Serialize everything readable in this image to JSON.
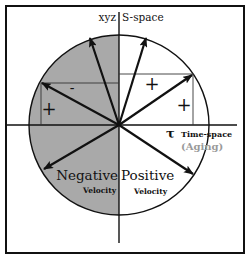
{
  "diagram": {
    "axes": {
      "vertical_label_left": "xyz",
      "vertical_label_right": "S-space",
      "horizontal_symbol": "τ",
      "horizontal_label": "Time-space",
      "horizontal_sublabel": "(Aging)"
    },
    "regions": {
      "negative_title": "Negative",
      "negative_sub": "Velocity",
      "positive_title": "Positive",
      "positive_sub": "Velocity"
    },
    "signs": {
      "left_box_top": "-",
      "left_box_side": "+",
      "right_box_top": "+",
      "right_box_side": "+"
    },
    "colors": {
      "negative_fill": "#a9a9a9",
      "line": "#111111",
      "aging_text": "#9a9a9a"
    }
  }
}
